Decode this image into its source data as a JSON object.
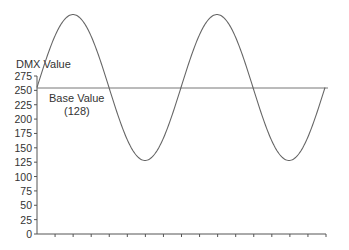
{
  "chart_data": {
    "type": "line",
    "title": "",
    "ylabel": "DMX Value",
    "xlabel": "",
    "ylim": [
      0,
      275
    ],
    "yticks": [
      0,
      25,
      50,
      75,
      100,
      125,
      150,
      175,
      200,
      225,
      250,
      275
    ],
    "xticks_count": 16,
    "grid": false,
    "legend": null,
    "annotations": [
      {
        "text_line1": "Base Value",
        "text_line2": "(128)"
      }
    ],
    "base_line": {
      "label": "Base Value (128)",
      "value_on_axis": 255
    },
    "series": [
      {
        "name": "Sine wave around base value",
        "shape": "sine",
        "cycles": 2,
        "base": 255,
        "peak": 382,
        "trough": 130,
        "x": [
          0,
          1,
          2,
          3,
          4,
          5,
          6,
          7,
          8,
          9,
          10,
          11,
          12,
          13,
          14,
          15,
          16
        ],
        "values": [
          255,
          345,
          382,
          345,
          255,
          165,
          130,
          165,
          255,
          345,
          382,
          345,
          255,
          165,
          130,
          165,
          255
        ]
      }
    ]
  },
  "labels": {
    "ylabel": "DMX Value",
    "base_line1": "Base Value",
    "base_line2": "(128)",
    "yticks": [
      "275",
      "250",
      "225",
      "200",
      "175",
      "150",
      "125",
      "100",
      "75",
      "50",
      "25",
      "0"
    ]
  },
  "colors": {
    "axis": "#555555",
    "curve": "#666666",
    "baseline": "#777777",
    "text": "#333333"
  }
}
